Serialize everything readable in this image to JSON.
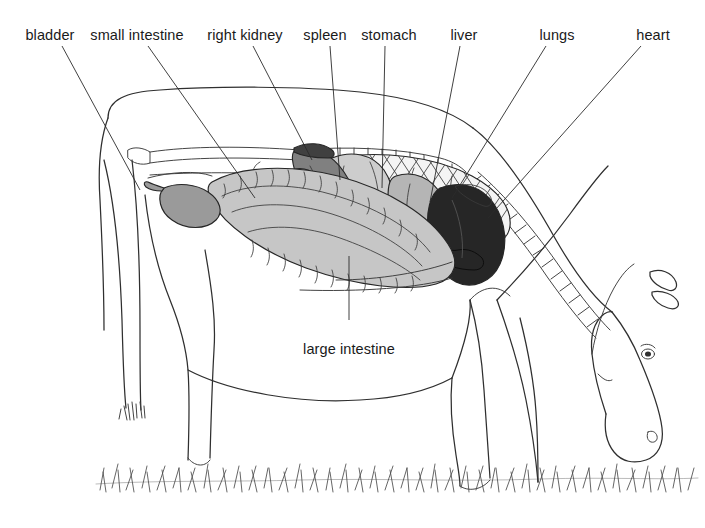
{
  "figure": {
    "kind": "anatomical-diagram",
    "background_color": "#ffffff",
    "line_color": "#2f2f2f",
    "text_color": "#1a1a1a",
    "width": 705,
    "height": 528,
    "top_cut_text": ""
  },
  "labels": {
    "bladder": "bladder",
    "small_intestine": "small intestine",
    "right_kidney": "right kidney",
    "spleen": "spleen",
    "stomach": "stomach",
    "liver": "liver",
    "lungs": "lungs",
    "heart": "heart",
    "large_intestine": "large intestine"
  },
  "organs": [
    {
      "name": "bladder",
      "label": "bladder",
      "fill": "#9a9a9a",
      "label_x": 50,
      "label_y": 35,
      "leader": "M 66,44 L 140,190"
    },
    {
      "name": "small-intestine",
      "label": "small intestine",
      "fill": "#b9b9b9",
      "label_x": 137,
      "label_y": 35,
      "leader": "M 147,44 L 253,196"
    },
    {
      "name": "right-kidney",
      "label": "right kidney",
      "fill": "#8e8e8e",
      "label_x": 245,
      "label_y": 35,
      "leader": "M 252,44 L 312,158"
    },
    {
      "name": "spleen",
      "label": "spleen",
      "fill": "#7d7d7d",
      "label_x": 325,
      "label_y": 35,
      "leader": "M 328,44 L 338,178"
    },
    {
      "name": "stomach",
      "label": "stomach",
      "fill": "#c9c9c9",
      "label_x": 389,
      "label_y": 35,
      "leader": "M 385,44 L 383,186"
    },
    {
      "name": "liver",
      "label": "liver",
      "fill": "#bdbdbd",
      "label_x": 464,
      "label_y": 35,
      "leader": "M 458,44 L 430,200"
    },
    {
      "name": "lungs",
      "label": "lungs",
      "fill": "#f2f2f2",
      "label_x": 557,
      "label_y": 35,
      "leader": "M 545,44 L 455,196"
    },
    {
      "name": "heart",
      "label": "heart",
      "fill": "#262626",
      "label_x": 653,
      "label_y": 35,
      "leader": "M 639,44 L 490,215"
    },
    {
      "name": "large-intestine",
      "label": "large intestine",
      "fill": "#c4c4c4",
      "label_x": 349,
      "label_y": 350,
      "leader": "M 349,318 L 349,258"
    }
  ],
  "colors": {
    "bladder": "#9a9a9a",
    "small_intestine": "#b0b0b0",
    "large_intestine": "#c6c6c6",
    "right_kidney": "#8a8a8a",
    "spleen": "#808080",
    "stomach": "#cdcdcd",
    "liver": "#b5b5b5",
    "lungs": "#f4f4f4",
    "heart": "#262626",
    "outline": "#2f2f2f",
    "grass": "#4a4a4a"
  }
}
